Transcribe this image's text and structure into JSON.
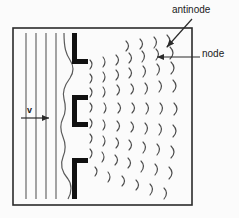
{
  "figure": {
    "background_color": "#fbfbfb",
    "frame": {
      "x": 13,
      "y": 28,
      "width": 179,
      "height": 177,
      "stroke_color": "#2b2b2b",
      "stroke_width": 1.6
    }
  },
  "labels": {
    "antinode": "antinode",
    "node": "node",
    "velocity": "v"
  },
  "colors": {
    "line": "#555555",
    "barrier": "#111111",
    "text": "#1a1a1a",
    "frame": "#2b2b2b",
    "arc": "#4d4d4d"
  },
  "incoming_wavefronts": {
    "description": "straight vertical plane wavefronts travelling to the right",
    "count": 4,
    "x_positions": [
      26,
      36,
      46,
      56
    ],
    "y_top": 33,
    "y_bottom": 199
  },
  "velocity_arrow": {
    "label": "v",
    "x_start": 21,
    "x_end": 51,
    "y": 118,
    "direction": "right"
  },
  "barrier": {
    "description": "three thick black bracket segments forming two slits",
    "segments": [
      {
        "shape": "L",
        "x": 71,
        "y": 33,
        "width": 16,
        "height": 32
      },
      {
        "shape": "C",
        "x": 71,
        "y": 95,
        "width": 16,
        "height": 32
      },
      {
        "shape": "gamma",
        "x": 71,
        "y": 158,
        "width": 16,
        "height": 32
      }
    ],
    "slit_count": 2
  },
  "wavy_front": {
    "description": "curved wavefront bending around the barrier openings",
    "x_center": 63,
    "y_top": 33,
    "y_bottom": 199
  },
  "diffracted_arcs": {
    "description": "crescent arcs radiating from the two slits forming interference pattern",
    "rows": 9,
    "per_row": 8,
    "color": "#4d4d4d"
  },
  "annotations": [
    {
      "name": "antinode",
      "text": "antinode",
      "arrow": {
        "x1": 192,
        "y1": 19,
        "x2": 166,
        "y2": 48,
        "direction": "down-left"
      }
    },
    {
      "name": "node",
      "text": "node",
      "arrow": {
        "x1": 199,
        "y1": 57,
        "x2": 155,
        "y2": 57,
        "direction": "left"
      }
    }
  ]
}
